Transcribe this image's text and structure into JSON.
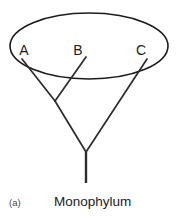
{
  "figure": {
    "panel_id": "(a)",
    "caption": "Monophylum",
    "width": 180,
    "height": 217,
    "background_color": "#ffffff",
    "line_color": "#2b2b2b",
    "outline_color": "#1c1c1c",
    "text_color": "#1c1c1c"
  },
  "taxa": [
    {
      "id": "A",
      "label": "A",
      "label_x": 24,
      "label_y": 55,
      "tip_x": 22,
      "tip_y": 59
    },
    {
      "id": "B",
      "label": "B",
      "label_x": 78,
      "label_y": 55,
      "tip_x": 86,
      "tip_y": 57
    },
    {
      "id": "C",
      "label": "C",
      "label_x": 141,
      "label_y": 55,
      "tip_x": 147,
      "tip_y": 59
    }
  ],
  "clade_ellipse": {
    "center_x": 89,
    "center_y": 46,
    "radius_x": 79,
    "radius_y": 33,
    "label": "monophyletic-group"
  },
  "tree": {
    "internal_node": {
      "x": 55,
      "y": 101
    },
    "root_node": {
      "x": 86,
      "y": 152
    },
    "stem_bottom": {
      "x": 86,
      "y": 183
    },
    "branches": [
      {
        "name": "branch-a",
        "from": "A-tip",
        "to": "internal-node",
        "x1": 22,
        "y1": 59,
        "x2": 55,
        "y2": 101
      },
      {
        "name": "branch-b",
        "from": "B-tip",
        "to": "internal-node",
        "x1": 86,
        "y1": 57,
        "x2": 55,
        "y2": 101
      },
      {
        "name": "branch-ab",
        "from": "internal-node",
        "to": "root-node",
        "x1": 55,
        "y1": 101,
        "x2": 86,
        "y2": 152
      },
      {
        "name": "branch-c",
        "from": "C-tip",
        "to": "root-node",
        "x1": 147,
        "y1": 59,
        "x2": 86,
        "y2": 152
      }
    ],
    "stem": {
      "x1": 86,
      "y1": 152,
      "x2": 86,
      "y2": 183
    }
  },
  "caption_position": {
    "x": 54,
    "y": 206
  },
  "panel_label_position": {
    "x": 9,
    "y": 206
  }
}
